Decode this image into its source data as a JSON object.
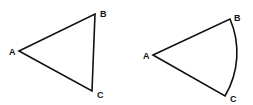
{
  "figures": [
    {
      "name": "triangle",
      "vertices": {
        "A": {
          "label": "A",
          "x": 19,
          "y": 51
        },
        "B": {
          "label": "B",
          "x": 95,
          "y": 14
        },
        "C": {
          "label": "C",
          "x": 92,
          "y": 91
        }
      },
      "side_BC": "straight"
    },
    {
      "name": "circular-sector",
      "vertices": {
        "A": {
          "label": "A",
          "x": 153,
          "y": 55
        },
        "B": {
          "label": "B",
          "x": 230,
          "y": 19
        },
        "C": {
          "label": "C",
          "x": 225,
          "y": 96
        }
      },
      "side_BC": "arc"
    }
  ],
  "colors": {
    "stroke": "#111111",
    "background": "#ffffff"
  }
}
